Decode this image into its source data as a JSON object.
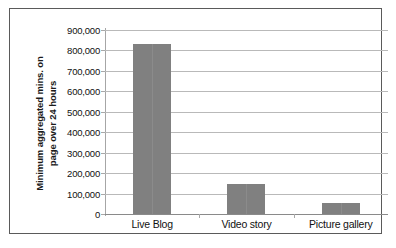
{
  "chart_data": {
    "type": "bar",
    "title": "",
    "subtitle": "",
    "xlabel": "",
    "ylabel": "Minimum aggregated mins. on page over 24 hours",
    "ylabel_lines": [
      "Minimum aggregated mins. on",
      "page over 24 hours"
    ],
    "categories": [
      "Live Blog",
      "Video story",
      "Picture gallery"
    ],
    "values": [
      830000,
      148000,
      55000
    ],
    "ylim": [
      0,
      900000
    ],
    "ytick_step": 100000,
    "ytick_labels": [
      "900,000",
      "800,000",
      "700,000",
      "600,000",
      "500,000",
      "400,000",
      "300,000",
      "200,000",
      "100,000",
      "0"
    ],
    "ytick_values": [
      900000,
      800000,
      700000,
      600000,
      500000,
      400000,
      300000,
      200000,
      100000,
      0
    ],
    "grid": "horizontal",
    "legend": "none",
    "series": [
      {
        "name": "Minimum aggregated mins. on page over 24 hours",
        "values": [
          830000,
          148000,
          55000
        ]
      }
    ],
    "colors": {
      "bar_fill": "#808080",
      "gridline": "#b9b9b9",
      "axis_line": "#8a8a8a",
      "text": "#111111",
      "frame_border": "#5a5a5a",
      "background": "#ffffff"
    }
  }
}
